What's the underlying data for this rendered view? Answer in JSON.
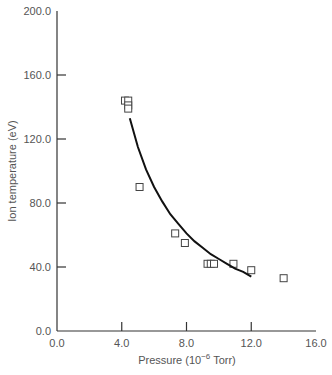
{
  "chart_data": {
    "type": "scatter",
    "title": "",
    "xlabel": "Pressure (10^-6 Torr)",
    "xlabel_parts": {
      "pre": "Pressure (10",
      "sup": "−6",
      "post": " Torr)"
    },
    "ylabel": "Ion temperature (eV)",
    "xlim": [
      0,
      16
    ],
    "ylim": [
      0,
      200
    ],
    "xticks": [
      0,
      4,
      8,
      12,
      16
    ],
    "xtick_labels": [
      "0.0",
      "4.0",
      "8.0",
      "12.0",
      "16.0"
    ],
    "yticks": [
      0,
      40,
      80,
      120,
      160,
      200
    ],
    "ytick_labels": [
      "0.0",
      "40.0",
      "80.0",
      "120.0",
      "160.0",
      "200.0"
    ],
    "grid": false,
    "legend": null,
    "series": [
      {
        "name": "Measured",
        "marker": "open-square",
        "points": [
          {
            "x": 4.2,
            "y": 144
          },
          {
            "x": 4.4,
            "y": 144
          },
          {
            "x": 4.4,
            "y": 141
          },
          {
            "x": 4.4,
            "y": 139
          },
          {
            "x": 5.1,
            "y": 90
          },
          {
            "x": 7.3,
            "y": 61
          },
          {
            "x": 7.9,
            "y": 55
          },
          {
            "x": 9.3,
            "y": 42
          },
          {
            "x": 9.5,
            "y": 42
          },
          {
            "x": 9.7,
            "y": 42
          },
          {
            "x": 10.9,
            "y": 42
          },
          {
            "x": 12.0,
            "y": 38
          },
          {
            "x": 14.0,
            "y": 33
          }
        ]
      },
      {
        "name": "Fit",
        "style": "line",
        "points": [
          {
            "x": 4.5,
            "y": 133
          },
          {
            "x": 5.0,
            "y": 115
          },
          {
            "x": 5.5,
            "y": 101
          },
          {
            "x": 6.0,
            "y": 90
          },
          {
            "x": 6.5,
            "y": 81
          },
          {
            "x": 7.0,
            "y": 73
          },
          {
            "x": 7.5,
            "y": 67
          },
          {
            "x": 8.0,
            "y": 61
          },
          {
            "x": 8.5,
            "y": 56
          },
          {
            "x": 9.0,
            "y": 52
          },
          {
            "x": 9.5,
            "y": 48
          },
          {
            "x": 10.0,
            "y": 45
          },
          {
            "x": 10.5,
            "y": 42
          },
          {
            "x": 11.0,
            "y": 39
          },
          {
            "x": 11.5,
            "y": 37
          },
          {
            "x": 12.0,
            "y": 34
          }
        ]
      }
    ]
  },
  "colors": {
    "axis": "#333333",
    "text": "#555555",
    "marker": "#444444",
    "curve": "#111111"
  }
}
